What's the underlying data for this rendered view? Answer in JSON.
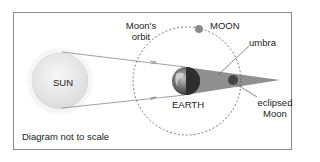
{
  "diagram": {
    "labels": {
      "sun": "SUN",
      "earth": "EARTH",
      "moon": "MOON",
      "moons_orbit_line1": "Moon's",
      "moons_orbit_line2": "orbit",
      "umbra": "umbra",
      "eclipsed_moon_line1": "eclipsed",
      "eclipsed_moon_line2": "Moon",
      "note": "Diagram not to scale"
    },
    "colors": {
      "frame": "#8a8a8a",
      "sun_fill": "#ebebeb",
      "sun_glow": "#f4f4f4",
      "ray": "#888888",
      "orbit": "#555555",
      "umbra": "#8f8f8f",
      "earth_dark": "#3a3a3a",
      "moon": "#8a8a8a",
      "eclipsed_moon": "#444444"
    }
  }
}
